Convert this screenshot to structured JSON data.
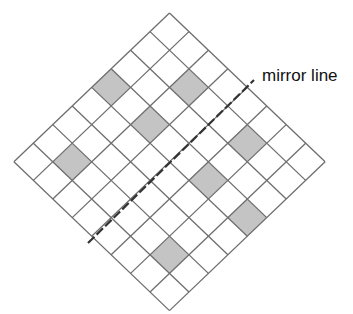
{
  "diagram": {
    "type": "reflection-grid",
    "grid": {
      "rows": 8,
      "cols": 8,
      "orientation": "rotated-45",
      "top_vertex": [
        169.5,
        13
      ],
      "step_x": 19.45,
      "step_y": 18.6,
      "line_color": "#6e6e6e",
      "cell_fill": "#ffffff"
    },
    "shaded_cells": [
      {
        "r": 3,
        "c": 0
      },
      {
        "r": 1,
        "c": 2
      },
      {
        "r": 3,
        "c": 2
      },
      {
        "r": 6,
        "c": 1
      },
      {
        "r": 1,
        "c": 5
      },
      {
        "r": 3,
        "c": 5
      },
      {
        "r": 3,
        "c": 7
      },
      {
        "r": 6,
        "c": 6
      }
    ],
    "shade_color": "#c4c4c4",
    "mirror_line": {
      "label": "mirror line",
      "from": [
        88,
        243
      ],
      "to": [
        254,
        80
      ],
      "color": "#333333"
    }
  }
}
